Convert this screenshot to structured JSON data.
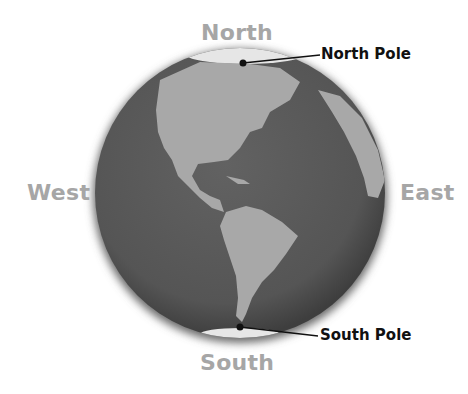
{
  "diagram": {
    "directions": {
      "north": "North",
      "south": "South",
      "east": "East",
      "west": "West"
    },
    "poles": {
      "north": "North Pole",
      "south": "South Pole"
    },
    "colors": {
      "ocean": "#5a5a5a",
      "land": "#a8a8a8",
      "ice": "#e6e6e6",
      "direction_text": "#a6a6a6",
      "label_text": "#111111"
    }
  }
}
